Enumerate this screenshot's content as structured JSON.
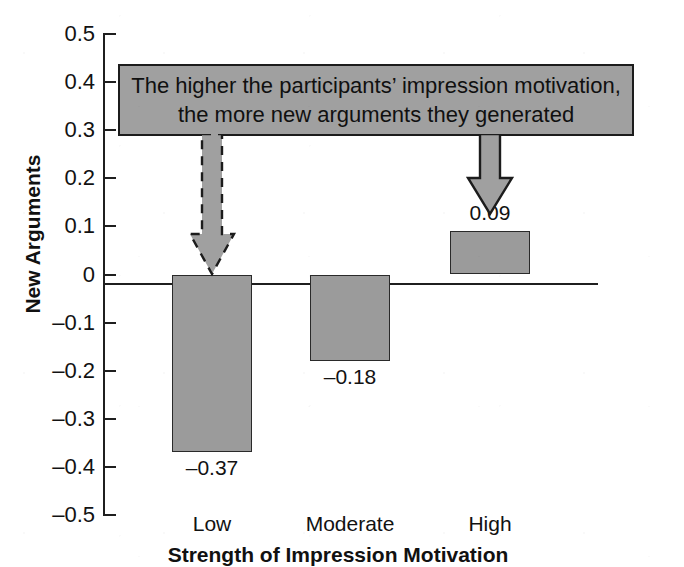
{
  "chart_data": {
    "type": "bar",
    "title": "",
    "categories": [
      "Low",
      "Moderate",
      "High"
    ],
    "values": [
      -0.37,
      -0.18,
      0.09
    ],
    "value_labels": [
      "–0.37",
      "–0.18",
      "0.09"
    ],
    "series": [
      {
        "name": "New Arguments",
        "values": [
          -0.37,
          -0.18,
          0.09
        ]
      }
    ],
    "xlabel": "Strength of Impression Motivation",
    "ylabel": "New Arguments",
    "ylim": [
      -0.5,
      0.5
    ],
    "ytick_step": 0.1,
    "ytick_labels": [
      "0.5",
      "0.4",
      "0.3",
      "0.2",
      "0.1",
      "0",
      "–0.1",
      "–0.2",
      "–0.3",
      "–0.4",
      "–0.5"
    ],
    "ytick_values": [
      0.5,
      0.4,
      0.3,
      0.2,
      0.1,
      0,
      -0.1,
      -0.2,
      -0.3,
      -0.4,
      -0.5
    ],
    "grid": false,
    "legend": "none",
    "bar_fill_color": "#9b9b9b",
    "bar_border_color": "#2a2a2a",
    "axis_color": "#1f1f1f",
    "annotations": [
      {
        "type": "callout",
        "lines": [
          "The higher the participants’ impression motivation,",
          "the more new arguments they generated"
        ],
        "fill_color": "#a0a0a0",
        "border_color": "#1c1c1c"
      },
      {
        "type": "arrow",
        "style": "dashed",
        "points_to": "Low"
      },
      {
        "type": "arrow",
        "style": "solid",
        "points_to": "High"
      }
    ]
  },
  "axes": {
    "y_title": "New Arguments",
    "x_title": "Strength of Impression Motivation"
  },
  "ticks": [
    {
      "label": "0.5",
      "value": 0.5
    },
    {
      "label": "0.4",
      "value": 0.4
    },
    {
      "label": "0.3",
      "value": 0.3
    },
    {
      "label": "0.2",
      "value": 0.2
    },
    {
      "label": "0.1",
      "value": 0.1
    },
    {
      "label": "0",
      "value": 0.0
    },
    {
      "label": "–0.1",
      "value": -0.1
    },
    {
      "label": "–0.2",
      "value": -0.2
    },
    {
      "label": "–0.3",
      "value": -0.3
    },
    {
      "label": "–0.4",
      "value": -0.4
    },
    {
      "label": "–0.5",
      "value": -0.5
    }
  ],
  "bars": [
    {
      "category": "Low",
      "value": -0.37,
      "label": "–0.37"
    },
    {
      "category": "Moderate",
      "value": -0.18,
      "label": "–0.18"
    },
    {
      "category": "High",
      "value": 0.09,
      "label": "0.09"
    }
  ],
  "callout": {
    "line1": "The higher the participants’ impression motivation,",
    "line2": "the more new arguments they generated"
  }
}
